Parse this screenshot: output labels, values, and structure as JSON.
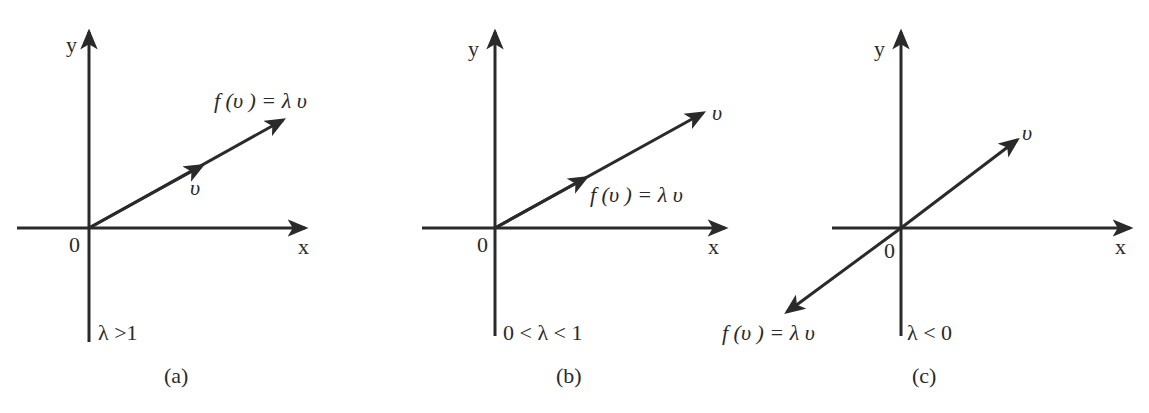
{
  "figure": {
    "panels": [
      {
        "id": "a",
        "caption": "(a)",
        "condition": "λ >1",
        "y_label": "y",
        "x_label": "x",
        "origin_label": "0",
        "vector_label": "υ",
        "image_label": "f (υ ) = λ υ"
      },
      {
        "id": "b",
        "caption": "(b)",
        "condition": "0 < λ < 1",
        "y_label": "y",
        "x_label": "x",
        "origin_label": "0",
        "vector_label": "υ",
        "image_label": "f (υ ) = λ υ"
      },
      {
        "id": "c",
        "caption": "(c)",
        "condition": "λ < 0",
        "y_label": "y",
        "x_label": "x",
        "origin_label": "0",
        "vector_label": "υ",
        "image_label": "f (υ ) = λ υ"
      }
    ],
    "colors": {
      "ink": "#2a2a2a",
      "background": "#ffffff"
    }
  }
}
